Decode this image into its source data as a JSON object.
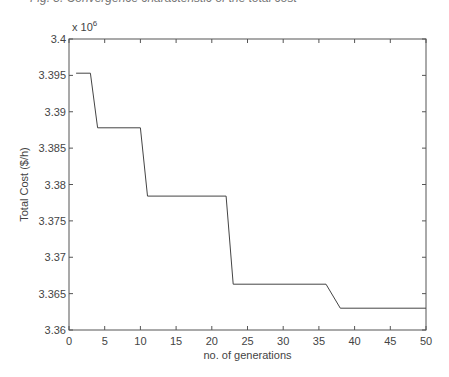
{
  "top_fragment": "Fig. 5. Convergence characteristic of the total cost",
  "chart_data": {
    "type": "line",
    "title": "",
    "xlabel": "no. of generations",
    "ylabel": "Total Cost ($/h)",
    "y_multiplier": "x 10^6",
    "y_multiplier_base": "x 10",
    "y_multiplier_exp": "6",
    "xlim": [
      0,
      50
    ],
    "ylim": [
      3.36,
      3.4
    ],
    "x_ticks": [
      0,
      5,
      10,
      15,
      20,
      25,
      30,
      35,
      40,
      45,
      50
    ],
    "y_ticks": [
      3.36,
      3.365,
      3.37,
      3.375,
      3.38,
      3.385,
      3.39,
      3.395,
      3.4
    ],
    "x_tick_labels": [
      "0",
      "5",
      "10",
      "15",
      "20",
      "25",
      "30",
      "35",
      "40",
      "45",
      "50"
    ],
    "y_tick_labels": [
      "3.36",
      "3.365",
      "3.37",
      "3.375",
      "3.38",
      "3.385",
      "3.39",
      "3.395",
      "3.4"
    ],
    "grid": false,
    "series": [
      {
        "name": "Total Cost",
        "x": [
          1,
          3,
          4,
          10,
          11,
          22,
          23,
          36,
          38,
          50
        ],
        "values": [
          3.3953,
          3.3953,
          3.3878,
          3.3878,
          3.3784,
          3.3784,
          3.3663,
          3.3663,
          3.363,
          3.363
        ]
      }
    ]
  }
}
